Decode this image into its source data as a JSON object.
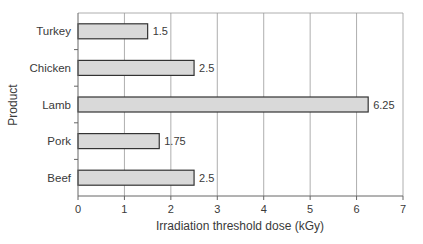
{
  "chart_data": {
    "type": "bar",
    "orientation": "horizontal",
    "title": "",
    "categories": [
      "Turkey",
      "Chicken",
      "Lamb",
      "Pork",
      "Beef"
    ],
    "values": [
      1.5,
      2.5,
      6.25,
      1.75,
      2.5
    ],
    "value_labels": [
      "1.5",
      "2.5",
      "6.25",
      "1.75",
      "2.5"
    ],
    "xlabel": "Irradiation threshold dose (kGy)",
    "ylabel": "Product",
    "xlim": [
      0,
      7
    ],
    "xticks": [
      0,
      1,
      2,
      3,
      4,
      5,
      6,
      7
    ],
    "grid": "vertical",
    "legend": null,
    "colors": {
      "bar_fill": "#d9d9d9",
      "bar_stroke": "#333333",
      "grid": "#999999",
      "axis": "#666666"
    }
  }
}
